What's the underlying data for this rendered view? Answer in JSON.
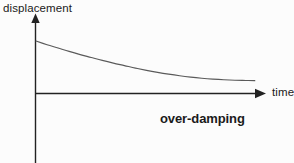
{
  "figure": {
    "background_color": "#fcfcfc",
    "axis_color": "#222222",
    "curve_color": "#5a5a5a",
    "text_color": "#1a1a1a",
    "y_axis_label": "displacement",
    "x_axis_label": "time",
    "annotation": "over-damping"
  },
  "chart_data": {
    "type": "line",
    "title": "",
    "subtitle": "",
    "xlabel": "time",
    "ylabel": "displacement",
    "xlim": [
      0,
      10
    ],
    "ylim": [
      -2.2,
      3.1
    ],
    "grid": false,
    "legend": null,
    "annotations": [
      {
        "text": "over-damping",
        "x": 5.5,
        "y": -0.75,
        "bold": true
      }
    ],
    "axes": {
      "x_axis_y_value": 0,
      "y_axis_x_value": 0,
      "x_axis_arrow": true,
      "y_axis_arrow": true,
      "x_tick_labels": [],
      "y_tick_labels": []
    },
    "series": [
      {
        "name": "over-damped displacement",
        "description": "Exponential decay toward zero without oscillation",
        "x": [
          0.0,
          0.5,
          1.0,
          1.5,
          2.0,
          2.5,
          3.0,
          3.5,
          4.0,
          4.5,
          5.0,
          5.5,
          6.0,
          6.5,
          7.0,
          7.5,
          8.0,
          8.5,
          9.0,
          9.5,
          9.9
        ],
        "y": [
          2.33,
          2.17,
          2.02,
          1.87,
          1.73,
          1.6,
          1.47,
          1.35,
          1.24,
          1.13,
          1.03,
          0.94,
          0.86,
          0.79,
          0.73,
          0.68,
          0.64,
          0.61,
          0.59,
          0.58,
          0.57
        ]
      }
    ]
  }
}
